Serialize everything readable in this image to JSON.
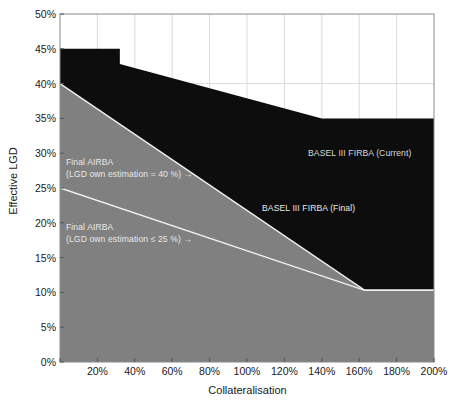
{
  "chart_data": {
    "type": "area",
    "title": "",
    "xlabel": "Collateralisation",
    "ylabel": "Effective LGD",
    "xlim": [
      0,
      200
    ],
    "ylim": [
      0,
      50
    ],
    "grid": true,
    "legend_position": "inline-annotations",
    "x_tick_labels": [
      "0%",
      "20%",
      "40%",
      "60%",
      "80%",
      "100%",
      "120%",
      "140%",
      "160%",
      "180%",
      "200%"
    ],
    "x_tick_values": [
      0,
      20,
      40,
      60,
      80,
      100,
      120,
      140,
      160,
      180,
      200
    ],
    "y_tick_labels": [
      "0%",
      "5%",
      "10%",
      "15%",
      "20%",
      "25%",
      "30%",
      "35%",
      "40%",
      "45%",
      "50%"
    ],
    "y_tick_values": [
      0,
      5,
      10,
      15,
      20,
      25,
      30,
      35,
      40,
      45,
      50
    ],
    "series": [
      {
        "name": "BASEL III FIRBA (Current)",
        "type": "step-then-linear-area",
        "color": "#0d0d0d",
        "points": [
          {
            "x": 0,
            "y": 45
          },
          {
            "x": 32,
            "y": 45
          },
          {
            "x": 32,
            "y": 42.8
          },
          {
            "x": 140,
            "y": 35
          },
          {
            "x": 200,
            "y": 35
          }
        ]
      },
      {
        "name": "BASEL III FIRBA (Final)",
        "type": "linear-area",
        "color": "#808080",
        "points": [
          {
            "x": 0,
            "y": 40
          },
          {
            "x": 163,
            "y": 10.3
          },
          {
            "x": 200,
            "y": 10.3
          }
        ]
      },
      {
        "name": "Final AIRBA (LGD own estimation = 40 %)",
        "type": "line",
        "color": "#f0f0f0",
        "points": [
          {
            "x": 0,
            "y": 40
          },
          {
            "x": 163,
            "y": 10.3
          },
          {
            "x": 200,
            "y": 10.3
          }
        ]
      },
      {
        "name": "Final AIRBA (LGD own estimation ≤ 25 %)",
        "type": "line",
        "color": "#f0f0f0",
        "points": [
          {
            "x": 0,
            "y": 25
          },
          {
            "x": 163,
            "y": 10.3
          },
          {
            "x": 200,
            "y": 10.3
          }
        ]
      }
    ],
    "annotations": [
      {
        "id": "annot-current",
        "text": "BASEL III FIRBA (Current)",
        "x": 150,
        "y": 30.5
      },
      {
        "id": "annot-final",
        "text": "BASEL III FIRBA (Final)",
        "x": 130,
        "y": 22.6
      },
      {
        "id": "annot-airba40-l1",
        "text": "Final AIRBA",
        "x": 4,
        "y": 31.0
      },
      {
        "id": "annot-airba40-l2",
        "text": "(LGD own estimation = 40 %) →",
        "x": 4,
        "y": 29.3
      },
      {
        "id": "annot-airba25-l1",
        "text": "Final AIRBA",
        "x": 4,
        "y": 21.8
      },
      {
        "id": "annot-airba25-l2",
        "text": "(LGD own estimation ≤ 25 %) →",
        "x": 4,
        "y": 20.1
      }
    ]
  },
  "colors": {
    "background": "#ffffff",
    "plot_border": "#8a8a8a",
    "grid": "#d0d0d0",
    "current_fill": "#0d0d0d",
    "final_fill": "#808080",
    "annotation_text": "#e8e8e8",
    "axis_text": "#1a1a1a"
  },
  "axis": {
    "y_title": "Effective LGD",
    "x_title": "Collateralisation"
  },
  "annotations_text": {
    "current": "BASEL III FIRBA (Current)",
    "final": "BASEL III FIRBA (Final)",
    "airba40_line1": "Final AIRBA",
    "airba40_line2": "(LGD own estimation = 40 %) →",
    "airba25_line1": "Final AIRBA",
    "airba25_line2": "(LGD own estimation ≤ 25 %) →"
  }
}
